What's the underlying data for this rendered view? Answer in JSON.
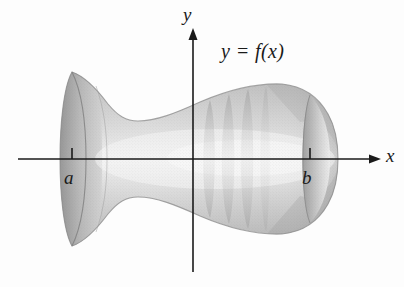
{
  "figure": {
    "background_color": "#fdfdfd",
    "ink_color": "#1a1a1a"
  },
  "axes": {
    "x_axis": {
      "label": "x",
      "start_x": 18,
      "end_x": 381,
      "y": 159,
      "arrow": "right"
    },
    "y_axis": {
      "label": "y",
      "x": 193,
      "top_y": 28,
      "bottom_y": 272,
      "arrow": "up"
    },
    "origin": {
      "x": 193,
      "y": 159
    }
  },
  "ticks": [
    {
      "name": "a",
      "label": "a",
      "x": 72,
      "axis": "x"
    },
    {
      "name": "b",
      "label": "b",
      "x": 310,
      "axis": "x"
    }
  ],
  "annotations": [
    {
      "name": "curve-equation",
      "label": "y = f(x)",
      "x": 221,
      "y": 40
    }
  ],
  "solid": {
    "description": "Bell-mouthed trumpet shape: wide flared opening at left near a, narrow waist at center-left, swelling to a rounded bulb with a rim near b at right",
    "fill_light": "#e8e8e8",
    "fill_mid": "#c9c9c9",
    "fill_dark": "#a6a6a6",
    "outline_color": "#8f8f8f",
    "profile_top": [
      {
        "x": 72,
        "y": 72
      },
      {
        "x": 86,
        "y": 78
      },
      {
        "x": 100,
        "y": 92
      },
      {
        "x": 115,
        "y": 110
      },
      {
        "x": 130,
        "y": 120
      },
      {
        "x": 150,
        "y": 120
      },
      {
        "x": 175,
        "y": 112
      },
      {
        "x": 205,
        "y": 99
      },
      {
        "x": 240,
        "y": 89
      },
      {
        "x": 275,
        "y": 84
      },
      {
        "x": 300,
        "y": 86
      },
      {
        "x": 322,
        "y": 100
      },
      {
        "x": 335,
        "y": 128
      },
      {
        "x": 338,
        "y": 159
      }
    ],
    "cross_sections": [
      {
        "name": "left-rim",
        "x": 72,
        "ry": 87
      },
      {
        "name": "flare-inner",
        "x": 92,
        "ry": 80
      },
      {
        "name": "band-1",
        "x": 210,
        "ry": 59
      },
      {
        "name": "band-2",
        "x": 229,
        "ry": 65
      },
      {
        "name": "band-3",
        "x": 247,
        "ry": 69
      },
      {
        "name": "right-rim",
        "x": 310,
        "ry": 66
      }
    ]
  }
}
